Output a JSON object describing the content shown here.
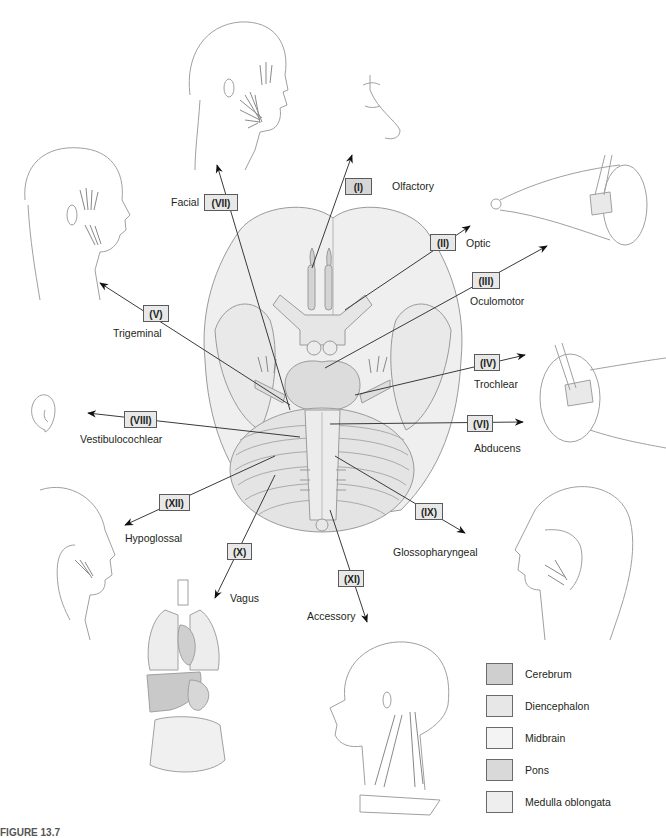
{
  "figure": {
    "caption_partial": "FIGURE 13.7"
  },
  "colors": {
    "cerebrum": "#cfcfcf",
    "diencephalon": "#e7e7e7",
    "midbrain": "#f1f1f1",
    "pons": "#dcdcdc",
    "medulla": "#ededed",
    "line": "#3a3a3a"
  },
  "nerves": [
    {
      "id": "I",
      "numeral": "(I)",
      "name": "Olfactory",
      "target": "nose"
    },
    {
      "id": "II",
      "numeral": "(II)",
      "name": "Optic",
      "target": "eye"
    },
    {
      "id": "III",
      "numeral": "(III)",
      "name": "Oculomotor",
      "target": "eye-muscles"
    },
    {
      "id": "IV",
      "numeral": "(IV)",
      "name": "Trochlear",
      "target": "eye-superior-oblique"
    },
    {
      "id": "V",
      "numeral": "(V)",
      "name": "Trigeminal",
      "target": "face-jaw-muscles"
    },
    {
      "id": "VI",
      "numeral": "(VI)",
      "name": "Abducens",
      "target": "eye-lateral-rectus"
    },
    {
      "id": "VII",
      "numeral": "(VII)",
      "name": "Facial",
      "target": "facial-muscles"
    },
    {
      "id": "VIII",
      "numeral": "(VIII)",
      "name": "Vestibulocochlear",
      "target": "ear"
    },
    {
      "id": "IX",
      "numeral": "(IX)",
      "name": "Glossopharyngeal",
      "target": "pharynx"
    },
    {
      "id": "X",
      "numeral": "(X)",
      "name": "Vagus",
      "target": "thoracic-abdominal-organs"
    },
    {
      "id": "XI",
      "numeral": "(XI)",
      "name": "Accessory",
      "target": "neck-muscles"
    },
    {
      "id": "XII",
      "numeral": "(XII)",
      "name": "Hypoglossal",
      "target": "tongue"
    }
  ],
  "legend": [
    {
      "label": "Cerebrum",
      "color": "#cfcfcf"
    },
    {
      "label": "Diencephalon",
      "color": "#e7e7e7"
    },
    {
      "label": "Midbrain",
      "color": "#f3f3f3"
    },
    {
      "label": "Pons",
      "color": "#d9d9d9"
    },
    {
      "label": "Medulla oblongata",
      "color": "#eeeeee"
    }
  ]
}
